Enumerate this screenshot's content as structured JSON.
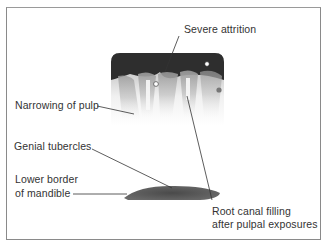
{
  "figure": {
    "type": "annotated radiograph",
    "labels": {
      "severe_attrition": "Severe attrition",
      "narrowing_of_pulp": "Narrowing of pulp",
      "genial_tubercles": "Genial tubercles",
      "lower_border_line1": "Lower border",
      "lower_border_line2": "of mandible",
      "root_canal_line1": "Root canal filling",
      "root_canal_line2": "after pulpal exposures"
    }
  }
}
